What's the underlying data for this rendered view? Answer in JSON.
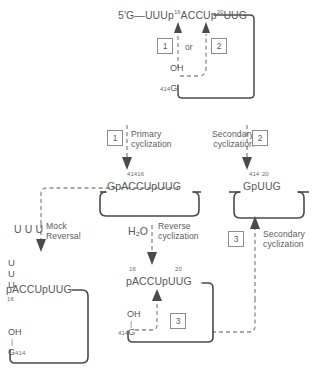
{
  "diagram": {
    "colors": {
      "line_solid": "#4a4a4a",
      "line_dashed": "#8c8c8c",
      "text": "#585858",
      "box_border": "#8c8c8c",
      "background": "#ffffff"
    },
    "top": {
      "sequence_prefix": "5'G—UUUp",
      "sequence_mid": "ACCUp",
      "sequence_suffix": "UUG",
      "label_16": "16",
      "label_20": "20",
      "box1": "1",
      "or": "or",
      "box2": "2",
      "oh": "OH",
      "g_num": "414",
      "g": "G"
    },
    "steps": {
      "primary_cyclization": {
        "box": "1",
        "line1": "Primary",
        "line2": "cyclization"
      },
      "secondary_cyclization_top": {
        "box": "2",
        "line1": "Secondary",
        "line2": "cyclization"
      },
      "mock_reversal": {
        "reagent": "U U U",
        "line1": "Mock",
        "line2": "Reversal"
      },
      "reverse_cyclization": {
        "reagent": "H₂O",
        "line1": "Reverse",
        "line2": "cyclization"
      },
      "secondary_cyclization_bottom": {
        "box": "3",
        "line1": "Secondary",
        "line2": "cyclization"
      }
    },
    "lariat_center": {
      "num_left": "414",
      "num_right": "16",
      "sequence": "GpACCUpUUG"
    },
    "lariat_right": {
      "num_left": "414",
      "num_right": "20",
      "sequence": "GpUUG"
    },
    "product_left": {
      "u1": "U",
      "u2": "U",
      "u3": "U",
      "sequence": "pACCUpUUG",
      "num": "16",
      "oh": "OH",
      "bond": "|",
      "g": "G",
      "g_num": "414"
    },
    "product_bottom": {
      "num_16": "16",
      "num_20": "20",
      "sequence": "pACCUpUUG",
      "oh": "OH",
      "bond": "|",
      "g_num": "414",
      "g": "G",
      "box3": "3"
    }
  }
}
